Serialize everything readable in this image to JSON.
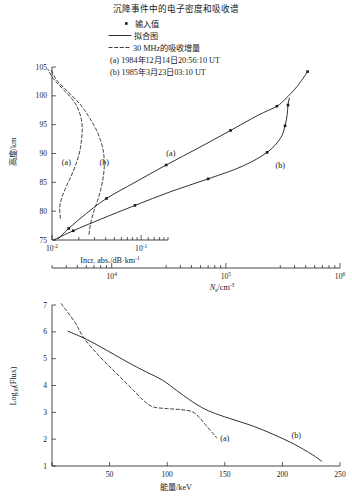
{
  "title": "沉降事件中的电子密度和吸收谱",
  "legend": {
    "marker_label": "输入值",
    "solid_label": "拟合图",
    "dashed_label": "30 MHz的吸收增量",
    "note_a": "(a) 1984年12月14日20:56:10 UT",
    "note_b": "(b) 1985年3月23日03:10 UT"
  },
  "chart_data": [
    {
      "type": "line",
      "id": "upper-panel",
      "title": "",
      "ylabel": "高度/km",
      "ylim": [
        75,
        105
      ],
      "yticks": [
        75,
        80,
        85,
        90,
        95,
        100,
        105
      ],
      "xlabel_bottom_axis": "Incr. abs./dB·km",
      "xlabel_bottom_axis_exp": "-1",
      "xlim_abs": [
        0.01,
        0.2
      ],
      "xticks_abs": [
        {
          "value": 0.01,
          "label": "10",
          "exp": "-2"
        },
        {
          "value": 0.1,
          "label": "10",
          "exp": "-1"
        }
      ],
      "xlabel_secondary_axis": "N",
      "xlabel_secondary_sub": "e",
      "xlabel_secondary_rest": "/cm",
      "xlabel_secondary_exp": "-3",
      "xlim_ne": [
        3000,
        1000000
      ],
      "xticks_ne": [
        {
          "value": 10000,
          "label": "10",
          "exp": "4"
        },
        {
          "value": 100000,
          "label": "10",
          "exp": "5"
        },
        {
          "value": 1000000,
          "label": "10",
          "exp": "6"
        }
      ],
      "grid": false,
      "legend_position": "top",
      "series": [
        {
          "name": "Ne fit (a)",
          "style": "solid",
          "label": "(a)",
          "label_at": [
            33000,
            89.5
          ],
          "x_axis": "ne",
          "points": [
            [
              3400,
              75.2
            ],
            [
              4200,
              77.0
            ],
            [
              6000,
              79.6
            ],
            [
              9000,
              82.2
            ],
            [
              16000,
              85.0
            ],
            [
              30000,
              88.0
            ],
            [
              58000,
              91.0
            ],
            [
              110000,
              94.0
            ],
            [
              190000,
              96.6
            ],
            [
              280000,
              98.2
            ],
            [
              330000,
              99.4
            ],
            [
              420000,
              101.6
            ],
            [
              520000,
              104.2
            ]
          ],
          "markers": [
            [
              4200,
              77.0
            ],
            [
              9000,
              82.2
            ],
            [
              30000,
              88.0
            ],
            [
              110000,
              94.0
            ],
            [
              280000,
              98.2
            ],
            [
              520000,
              104.2
            ]
          ]
        },
        {
          "name": "Ne fit (b)",
          "style": "solid",
          "label": "(b)",
          "label_at": [
            300000,
            87.5
          ],
          "x_axis": "ne",
          "points": [
            [
              3100,
              75.0
            ],
            [
              4600,
              76.6
            ],
            [
              8000,
              78.6
            ],
            [
              16000,
              81.0
            ],
            [
              33000,
              83.4
            ],
            [
              70000,
              85.6
            ],
            [
              140000,
              87.8
            ],
            [
              230000,
              90.2
            ],
            [
              300000,
              92.6
            ],
            [
              330000,
              94.8
            ],
            [
              345000,
              96.8
            ],
            [
              350000,
              98.4
            ],
            [
              360000,
              99.6
            ]
          ],
          "markers": [
            [
              4600,
              76.6
            ],
            [
              16000,
              81.0
            ],
            [
              70000,
              85.6
            ],
            [
              230000,
              90.2
            ],
            [
              330000,
              94.8
            ],
            [
              350000,
              98.4
            ]
          ]
        },
        {
          "name": "30 MHz incremental absorption (a)",
          "style": "dashed",
          "label": "(a)",
          "label_at": [
            0.0145,
            88.0
          ],
          "x_axis": "abs",
          "points": [
            [
              0.0124,
              78.8
            ],
            [
              0.0122,
              80.6
            ],
            [
              0.0128,
              82.2
            ],
            [
              0.0142,
              84.0
            ],
            [
              0.0163,
              86.0
            ],
            [
              0.0186,
              88.2
            ],
            [
              0.0205,
              90.4
            ],
            [
              0.0215,
              92.6
            ],
            [
              0.0218,
              94.6
            ],
            [
              0.021,
              96.4
            ],
            [
              0.019,
              98.2
            ],
            [
              0.0165,
              99.6
            ],
            [
              0.014,
              100.8
            ],
            [
              0.0118,
              102.0
            ],
            [
              0.0101,
              103.2
            ],
            [
              0.009,
              104.6
            ]
          ],
          "markers": []
        },
        {
          "name": "30 MHz incremental absorption (b)",
          "style": "dashed",
          "label": "(b)",
          "label_at": [
            0.0385,
            88.0
          ],
          "x_axis": "abs",
          "points": [
            [
              0.026,
              76.0
            ],
            [
              0.0272,
              78.0
            ],
            [
              0.0298,
              80.2
            ],
            [
              0.033,
              82.2
            ],
            [
              0.0358,
              84.2
            ],
            [
              0.0378,
              86.2
            ],
            [
              0.0386,
              88.2
            ],
            [
              0.0378,
              90.2
            ],
            [
              0.0352,
              92.2
            ],
            [
              0.0312,
              94.2
            ],
            [
              0.0268,
              96.0
            ],
            [
              0.023,
              97.6
            ],
            [
              0.02,
              98.8
            ],
            [
              0.0168,
              100.0
            ],
            [
              0.0136,
              101.4
            ],
            [
              0.0112,
              102.8
            ],
            [
              0.0098,
              104.4
            ]
          ],
          "markers": []
        }
      ]
    },
    {
      "type": "line",
      "id": "lower-panel",
      "title": "",
      "xlabel": "能量/keV",
      "ylabel": "Log",
      "ylabel_sub": "10",
      "ylabel_rest": "(Flux)",
      "xlim": [
        0,
        250
      ],
      "ylim": [
        1,
        7
      ],
      "xticks": [
        0,
        50,
        100,
        150,
        200,
        250
      ],
      "xtick_labels": [
        "",
        "50",
        "100",
        "150",
        "200",
        "250"
      ],
      "yticks": [
        1,
        2,
        3,
        4,
        5,
        6,
        7
      ],
      "grid": false,
      "series": [
        {
          "name": "flux spectrum (a)",
          "style": "dashed",
          "label": "(a)",
          "label_at": [
            150,
            1.95
          ],
          "points": [
            [
              8,
              7.05
            ],
            [
              20,
              6.35
            ],
            [
              28,
              5.75
            ],
            [
              42,
              5.05
            ],
            [
              56,
              4.45
            ],
            [
              70,
              3.85
            ],
            [
              80,
              3.42
            ],
            [
              88,
              3.2
            ],
            [
              100,
              3.14
            ],
            [
              112,
              3.1
            ],
            [
              122,
              3.02
            ],
            [
              128,
              2.8
            ],
            [
              134,
              2.5
            ],
            [
              140,
              2.2
            ],
            [
              143,
              2.05
            ]
          ],
          "markers": []
        },
        {
          "name": "flux spectrum (b)",
          "style": "solid",
          "label": "(b)",
          "label_at": [
            212,
            2.05
          ],
          "points": [
            [
              14,
              6.02
            ],
            [
              30,
              5.72
            ],
            [
              48,
              5.3
            ],
            [
              66,
              4.86
            ],
            [
              82,
              4.5
            ],
            [
              96,
              4.2
            ],
            [
              108,
              3.82
            ],
            [
              120,
              3.45
            ],
            [
              130,
              3.18
            ],
            [
              142,
              2.95
            ],
            [
              158,
              2.72
            ],
            [
              175,
              2.48
            ],
            [
              192,
              2.18
            ],
            [
              210,
              1.82
            ],
            [
              226,
              1.42
            ],
            [
              234,
              1.18
            ]
          ],
          "markers": []
        }
      ]
    }
  ]
}
